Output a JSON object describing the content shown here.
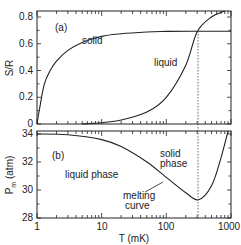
{
  "chart_data": [
    {
      "panel": "(a)",
      "type": "line",
      "title": "",
      "xlabel": "T (mK)",
      "ylabel": "S/R",
      "xscale": "log",
      "xlim": [
        1,
        1000
      ],
      "ylim": [
        0,
        0.85
      ],
      "x_ticks": [
        "1",
        "10",
        "100",
        "1000"
      ],
      "y_ticks": [
        "0",
        "0.2",
        "0.4",
        "0.6",
        "0.8"
      ],
      "grid": false,
      "series": [
        {
          "name": "solid",
          "x": [
            1,
            1.1,
            1.3,
            1.6,
            2,
            3,
            5,
            10,
            20,
            50,
            100,
            300,
            1000
          ],
          "values": [
            0.0,
            0.12,
            0.3,
            0.4,
            0.47,
            0.55,
            0.61,
            0.655,
            0.675,
            0.688,
            0.692,
            0.693,
            0.693
          ]
        },
        {
          "name": "liquid",
          "x": [
            5,
            10,
            20,
            50,
            100,
            200,
            300,
            500,
            800
          ],
          "values": [
            0.0,
            0.01,
            0.03,
            0.09,
            0.2,
            0.44,
            0.69,
            0.8,
            0.86
          ]
        }
      ],
      "annotations": [
        {
          "text": "solid",
          "x": 20,
          "y": 0.6
        },
        {
          "text": "liquid",
          "x": 70,
          "y": 0.38
        },
        {
          "text": "dotted vertical line at T ≈ 315 mK (crossing of solid and liquid entropy at S/R ≈ 0.69)"
        }
      ]
    },
    {
      "panel": "(b)",
      "type": "line",
      "title": "",
      "xlabel": "T (mK)",
      "ylabel": "P_m (atm)",
      "xscale": "log",
      "xlim": [
        1,
        1000
      ],
      "ylim": [
        28,
        34.3
      ],
      "x_ticks": [
        "1",
        "10",
        "100",
        "1000"
      ],
      "y_ticks": [
        "28",
        "30",
        "32",
        "34"
      ],
      "grid": false,
      "series": [
        {
          "name": "melting curve",
          "x": [
            1,
            3,
            10,
            20,
            50,
            100,
            200,
            315,
            500,
            700,
            900
          ],
          "values": [
            34.0,
            33.95,
            33.6,
            33.1,
            32.0,
            30.9,
            29.8,
            29.3,
            30.3,
            32.3,
            34.2
          ]
        }
      ],
      "annotations": [
        {
          "text": "liquid phase",
          "x": 8,
          "y": 31.5
        },
        {
          "text": "solid phase",
          "x": 100,
          "y": 32.0
        },
        {
          "text": "melting curve",
          "x": 20,
          "y": 29.8
        },
        {
          "text": "minimum at T ≈ 315 mK, P ≈ 29.3 atm (dotted line)"
        }
      ]
    }
  ],
  "labels": {
    "panel_a": "(a)",
    "panel_b": "(b)",
    "ylabel_a": "S/R",
    "ylabel_b_main": "P",
    "ylabel_b_sub": "m",
    "ylabel_b_unit": " (atm)",
    "xlabel": "T  (mK)",
    "solid": "solid",
    "liquid": "liquid",
    "liquid_phase": "liquid phase",
    "solid_phase_1": "solid",
    "solid_phase_2": "phase",
    "melting_1": "melting",
    "melting_2": "curve"
  },
  "ticks": {
    "x": [
      "1",
      "10",
      "100",
      "1000"
    ],
    "ya": [
      "0",
      "0.2",
      "0.4",
      "0.6",
      "0.8"
    ],
    "yb": [
      "28",
      "30",
      "32",
      "34"
    ]
  }
}
